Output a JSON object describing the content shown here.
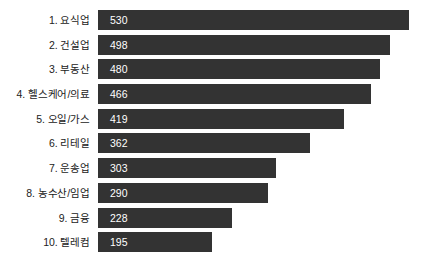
{
  "chart_data": {
    "type": "bar",
    "orientation": "horizontal",
    "title": "",
    "subtitle": "",
    "xlabel": "",
    "ylabel": "",
    "grid": false,
    "legend": null,
    "axis_visible": false,
    "value_labels_inside_bars": true,
    "xlim": [
      0,
      530
    ],
    "categories": [
      "1. 요식업",
      "2. 건설업",
      "3. 부동산",
      "4. 헬스케어/의료",
      "5. 오일/가스",
      "6. 리테일",
      "7. 운송업",
      "8. 농수산/임업",
      "9. 금융",
      "10. 텔레컴"
    ],
    "values": [
      530,
      498,
      480,
      466,
      419,
      362,
      303,
      290,
      228,
      195
    ],
    "bar_color": "#333333",
    "value_label_color": "#ffffff",
    "category_label_color": "#222222",
    "background_color": "#ffffff"
  },
  "rows": [
    {
      "label": "1. 요식업",
      "value": "530",
      "pct": 100.0
    },
    {
      "label": "2. 건설업",
      "value": "498",
      "pct": 93.96
    },
    {
      "label": "3. 부동산",
      "value": "480",
      "pct": 90.57
    },
    {
      "label": "4. 헬스케어/의료",
      "value": "466",
      "pct": 87.92
    },
    {
      "label": "5. 오일/가스",
      "value": "419",
      "pct": 79.06
    },
    {
      "label": "6. 리테일",
      "value": "362",
      "pct": 68.3
    },
    {
      "label": "7. 운송업",
      "value": "303",
      "pct": 57.17
    },
    {
      "label": "8. 농수산/임업",
      "value": "290",
      "pct": 54.72
    },
    {
      "label": "9. 금융",
      "value": "228",
      "pct": 43.02
    },
    {
      "label": "10. 텔레컴",
      "value": "195",
      "pct": 36.79
    }
  ]
}
